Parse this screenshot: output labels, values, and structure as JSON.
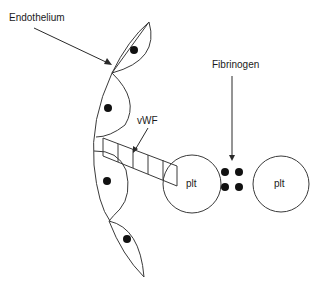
{
  "diagram": {
    "labels": {
      "endothelium": "Endothelium",
      "vwf": "vWF",
      "fibrinogen": "Fibrinogen",
      "platelet_left": "plt",
      "platelet_right": "plt"
    },
    "endothelial_cells": 5,
    "fibrinogen_dots": 4,
    "vwf_segments": 4,
    "colors": {
      "stroke": "#3a3a3a",
      "fill_dots": "#111111",
      "background": "#ffffff"
    }
  }
}
